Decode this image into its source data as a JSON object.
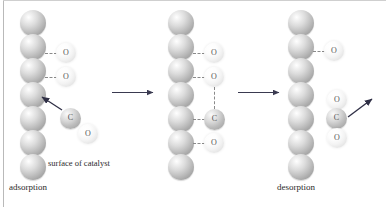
{
  "figure": {
    "type": "process-diagram",
    "stages": [
      {
        "id": "adsorption",
        "label": "adsorption",
        "surface_label": "surface of catalyst",
        "surface_atom_count": 7,
        "adsorbed_atoms": [
          "O",
          "O"
        ],
        "incoming_molecule": [
          "C",
          "O"
        ],
        "arrow": "approach-arrow"
      },
      {
        "id": "reaction",
        "label": "",
        "surface_label": "",
        "surface_atom_count": 7,
        "adsorbed_atoms": [
          "O",
          "O",
          "C",
          "O"
        ],
        "incoming_molecule": [],
        "arrow": "bond-forming-dashed"
      },
      {
        "id": "desorption",
        "label": "desorption",
        "surface_label": "",
        "surface_atom_count": 7,
        "adsorbed_atoms": [
          "O"
        ],
        "departing_molecule": [
          "O",
          "C",
          "O"
        ],
        "arrow": "escape-arrow"
      }
    ],
    "atom_labels": {
      "oxygen": "O",
      "carbon": "C"
    },
    "transition_arrows": [
      "arrow-1",
      "arrow-2"
    ],
    "colors": {
      "surface_sphere": "#c2c2c2",
      "oxygen_atom": "#f0f0f0",
      "carbon_atom": "#c0c0c0",
      "arrow": "#3a3a50",
      "bond_dash": "#8a8a8a",
      "text": "#2a2a2a",
      "background": "#ffffff",
      "frame": "#b9b9b9"
    }
  }
}
